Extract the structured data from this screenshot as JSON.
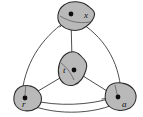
{
  "figure": {
    "type": "topological-graph-diagram",
    "width": 143,
    "height": 117,
    "background_color": "#ffffff",
    "blob_fill_color": "#b9b9b9",
    "blob_stroke_color": "#2b2b2b",
    "edge_color": "#3a3a3a",
    "dot_color": "#0d0d0d",
    "label_color": "#111111"
  },
  "nodes": [
    {
      "id": "node-x",
      "label": "x",
      "position": "top",
      "dot_x": 71,
      "dot_y": 14,
      "label_x": 84,
      "label_y": 15
    },
    {
      "id": "node-t",
      "label": "t",
      "position": "center",
      "dot_x": 73,
      "dot_y": 70,
      "label_x": 63,
      "label_y": 70
    },
    {
      "id": "node-r",
      "label": "r",
      "position": "bottom-left",
      "dot_x": 25,
      "dot_y": 98,
      "label_x": 24,
      "label_y": 104
    },
    {
      "id": "node-a",
      "label": "a",
      "position": "bottom-right",
      "dot_x": 118,
      "dot_y": 97,
      "label_x": 123,
      "label_y": 104
    }
  ],
  "edges": [
    {
      "id": "edge-x-r",
      "from": "x",
      "to": "r",
      "style": "curved-arc"
    },
    {
      "id": "edge-x-a",
      "from": "x",
      "to": "a",
      "style": "curved-arc"
    },
    {
      "id": "edge-r-a",
      "from": "r",
      "to": "a",
      "style": "curved-arc"
    },
    {
      "id": "edge-t-x",
      "from": "t",
      "to": "x",
      "style": "straight"
    },
    {
      "id": "edge-t-r",
      "from": "t",
      "to": "r",
      "style": "straight"
    },
    {
      "id": "edge-t-a",
      "from": "t",
      "to": "a",
      "style": "straight"
    }
  ]
}
